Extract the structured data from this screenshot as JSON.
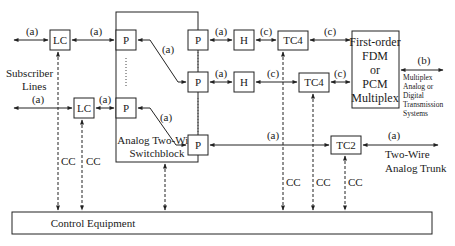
{
  "diagram": {
    "type": "block-diagram",
    "blocks": {
      "lc1": "LC",
      "lc2": "LC",
      "p_in1": "P",
      "p_in2": "P",
      "p_out1": "P",
      "p_out2": "P",
      "p_out3": "P",
      "h1": "H",
      "h2": "H",
      "tc4_1": "TC4",
      "tc4_2": "TC4",
      "tc2": "TC2",
      "mux_line1": "First-order",
      "mux_line2": "FDM",
      "mux_line3": "or",
      "mux_line4": "PCM",
      "mux_line5": "Multiplex",
      "switch_line1": "Analog Two-Wire",
      "switch_line2": "Switchblock",
      "control": "Control Equipment"
    },
    "labels": {
      "a": "(a)",
      "b": "(b)",
      "c": "(c)",
      "cc": "CC",
      "subscriber_line1": "Subscriber",
      "subscriber_line2": "Lines",
      "trunk_line1": "Two-Wire",
      "trunk_line2": "Analog Trunk",
      "tx_line1": "Multiplex",
      "tx_line2": "Analog or",
      "tx_line3": "Digital",
      "tx_line4": "Transmission",
      "tx_line5": "Systems"
    }
  }
}
